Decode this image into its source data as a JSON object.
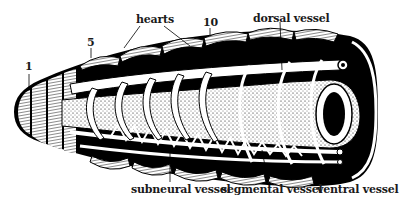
{
  "diagram": {
    "labels": {
      "seg1": "1",
      "seg5": "5",
      "seg10": "10",
      "hearts": "hearts",
      "dorsal_vessel": "dorsal vessel",
      "subneural_vessel": "subneural vessel",
      "segmental_vessel": "segmental vessel",
      "ventral_vessel": "ventral vessel"
    },
    "colors": {
      "ink": "#000000",
      "paper": "#ffffff",
      "label": "#1a1a1a"
    }
  }
}
